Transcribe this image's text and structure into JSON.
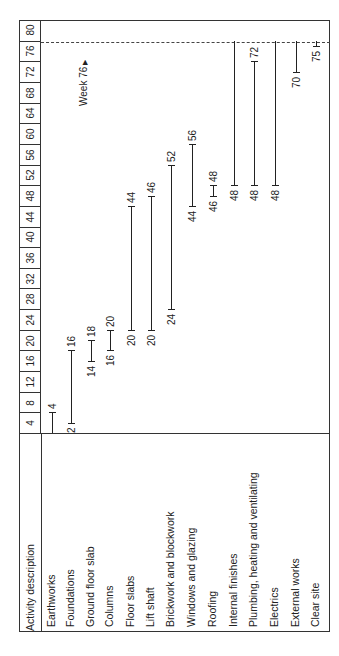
{
  "chart_data": {
    "type": "gantt",
    "orientation": "rotated-90-ccw",
    "title": "",
    "xlabel": "Week",
    "ylabel": "Activity description",
    "week_ticks": [
      4,
      8,
      12,
      16,
      20,
      24,
      28,
      32,
      36,
      40,
      44,
      48,
      52,
      56,
      60,
      64,
      68,
      72,
      76,
      80
    ],
    "xlim": [
      0,
      80
    ],
    "header": "Activity description",
    "marker": {
      "week": 76,
      "label": "Week 76",
      "style": "dashed"
    },
    "activities": [
      {
        "name": "Earthworks",
        "start": 0,
        "end": 4,
        "start_label": "",
        "end_label": "4"
      },
      {
        "name": "Foundations",
        "start": 2,
        "end": 16,
        "start_label": "2",
        "end_label": "16"
      },
      {
        "name": "Ground floor slab",
        "start": 14,
        "end": 18,
        "start_label": "14",
        "end_label": "18"
      },
      {
        "name": "Columns",
        "start": 16,
        "end": 20,
        "start_label": "16",
        "end_label": "20"
      },
      {
        "name": "Floor slabs",
        "start": 20,
        "end": 44,
        "start_label": "20",
        "end_label": "44"
      },
      {
        "name": "Lift shaft",
        "start": 20,
        "end": 46,
        "start_label": "20",
        "end_label": "46"
      },
      {
        "name": "Brickwork and blockwork",
        "start": 24,
        "end": 52,
        "start_label": "24",
        "end_label": "52"
      },
      {
        "name": "Windows and glazing",
        "start": 44,
        "end": 56,
        "start_label": "44",
        "end_label": "56"
      },
      {
        "name": "Roofing",
        "start": 46,
        "end": 48,
        "start_label": "46",
        "end_label": "48"
      },
      {
        "name": "Internal finishes",
        "start": 48,
        "end": 76,
        "start_label": "48",
        "end_label": ""
      },
      {
        "name": "Plumbing, heating and ventilating",
        "start": 48,
        "end": 72,
        "start_label": "48",
        "end_label": "72"
      },
      {
        "name": "Electrics",
        "start": 48,
        "end": 76,
        "start_label": "48",
        "end_label": ""
      },
      {
        "name": "External works",
        "start": 70,
        "end": 76,
        "start_label": "70",
        "end_label": ""
      },
      {
        "name": "Clear site",
        "start": 75,
        "end": 76,
        "start_label": "75",
        "end_label": ""
      }
    ]
  }
}
